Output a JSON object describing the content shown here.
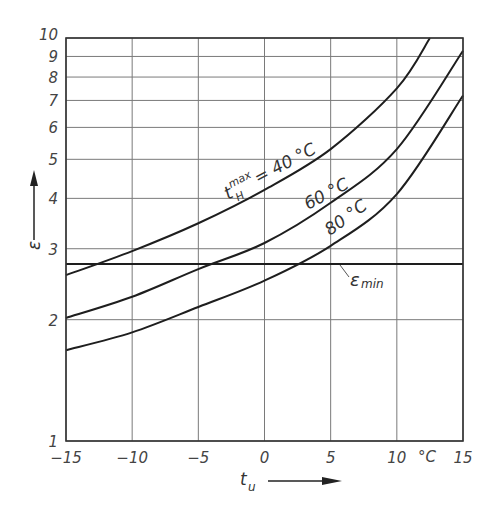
{
  "chart_data": {
    "type": "line",
    "title": "",
    "xlabel": "t_u",
    "xunit": "°C",
    "ylabel": "ε",
    "yscale": "log",
    "xlim": [
      -15,
      15
    ],
    "ylim": [
      1,
      10
    ],
    "grid": true,
    "x_ticks": [
      -15,
      -10,
      -5,
      0,
      5,
      10,
      15
    ],
    "x_tick_labels": [
      "−15",
      "−10",
      "−5",
      "0",
      "5",
      "10",
      "15"
    ],
    "y_ticks": [
      1,
      2,
      3,
      4,
      5,
      6,
      7,
      8,
      9,
      10
    ],
    "y_tick_labels": [
      "1",
      "2",
      "3",
      "4",
      "5",
      "6",
      "7",
      "8",
      "9",
      "10"
    ],
    "series": [
      {
        "name": "t_H^max = 40 °C",
        "label": "40 °C",
        "x": [
          -15,
          -10,
          -5,
          0,
          5,
          10,
          12.5
        ],
        "values": [
          2.58,
          2.96,
          3.47,
          4.2,
          5.3,
          7.5,
          10.0
        ]
      },
      {
        "name": "60 °C",
        "label": "60 °C",
        "x": [
          -15,
          -10,
          -5,
          0,
          5,
          10,
          15
        ],
        "values": [
          2.02,
          2.28,
          2.67,
          3.1,
          3.9,
          5.3,
          9.3
        ]
      },
      {
        "name": "80 °C",
        "label": "80 °C",
        "x": [
          -15,
          -10,
          -5,
          0,
          5,
          10,
          15
        ],
        "values": [
          1.68,
          1.86,
          2.15,
          2.5,
          3.05,
          4.1,
          7.2
        ]
      }
    ],
    "reference_lines": [
      {
        "name": "ε_min",
        "label": "ε min",
        "y": 2.75
      }
    ],
    "annotations": [
      {
        "text": "t_H^max = 40 °C",
        "near_series": "40 °C"
      },
      {
        "text": "60 °C",
        "near_series": "60 °C"
      },
      {
        "text": "80 °C",
        "near_series": "80 °C"
      },
      {
        "text": "ε_min",
        "near": "reference line"
      },
      {
        "text": "°C",
        "near": "x-axis unit"
      }
    ]
  },
  "labels": {
    "y_axis_symbol": "ε",
    "x_axis_symbol": "t",
    "x_axis_subscript": "u",
    "x_unit": "°C",
    "emin_main": "ε",
    "emin_sub": "min",
    "curve40_t": "t",
    "curve40_sup": "max",
    "curve40_sub": "H",
    "curve40_rest": "= 40 °C",
    "curve60": "60 °C",
    "curve80": "80 °C"
  }
}
